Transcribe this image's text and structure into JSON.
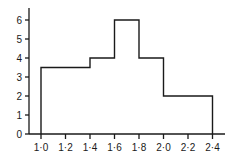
{
  "chart_data": {
    "type": "bar",
    "subtype": "histogram",
    "title": "",
    "xlabel": "",
    "ylabel": "",
    "bins": [
      {
        "start": 1.0,
        "end": 1.4,
        "value": 3.5
      },
      {
        "start": 1.4,
        "end": 1.6,
        "value": 4
      },
      {
        "start": 1.6,
        "end": 1.8,
        "value": 6
      },
      {
        "start": 1.8,
        "end": 2.0,
        "value": 4
      },
      {
        "start": 2.0,
        "end": 2.4,
        "value": 2
      }
    ],
    "categories": [
      "1.0-1.4",
      "1.4-1.6",
      "1.6-1.8",
      "1.8-2.0",
      "2.0-2.4"
    ],
    "values": [
      3.5,
      4,
      6,
      4,
      2
    ],
    "x_ticks": [
      "1·0",
      "1·2",
      "1·4",
      "1·6",
      "1·8",
      "2·0",
      "2·2",
      "2·4"
    ],
    "x_tick_values": [
      1.0,
      1.2,
      1.4,
      1.6,
      1.8,
      2.0,
      2.2,
      2.4
    ],
    "y_ticks": [
      "0",
      "1",
      "2",
      "3",
      "4",
      "5",
      "6"
    ],
    "y_tick_values": [
      0,
      1,
      2,
      3,
      4,
      5,
      6
    ],
    "xlim": [
      0.9,
      2.5
    ],
    "ylim": [
      0,
      6.7
    ],
    "grid": false,
    "legend": null
  },
  "style": {
    "line_color": "#1a1a1a",
    "background": "#ffffff"
  }
}
